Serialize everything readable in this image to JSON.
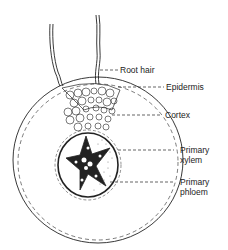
{
  "diagram": {
    "labels": [
      {
        "id": "root-hair",
        "text": "Root hair"
      },
      {
        "id": "epidermis",
        "text": "Epidermis"
      },
      {
        "id": "cortex",
        "text": "Cortex"
      },
      {
        "id": "primary-xylem",
        "line1": "Primary",
        "line2": "xylem"
      },
      {
        "id": "primary-phloem",
        "line1": "Primary",
        "line2": "phloem"
      }
    ],
    "colors": {
      "ink": "#222222",
      "background": "#ffffff"
    }
  }
}
